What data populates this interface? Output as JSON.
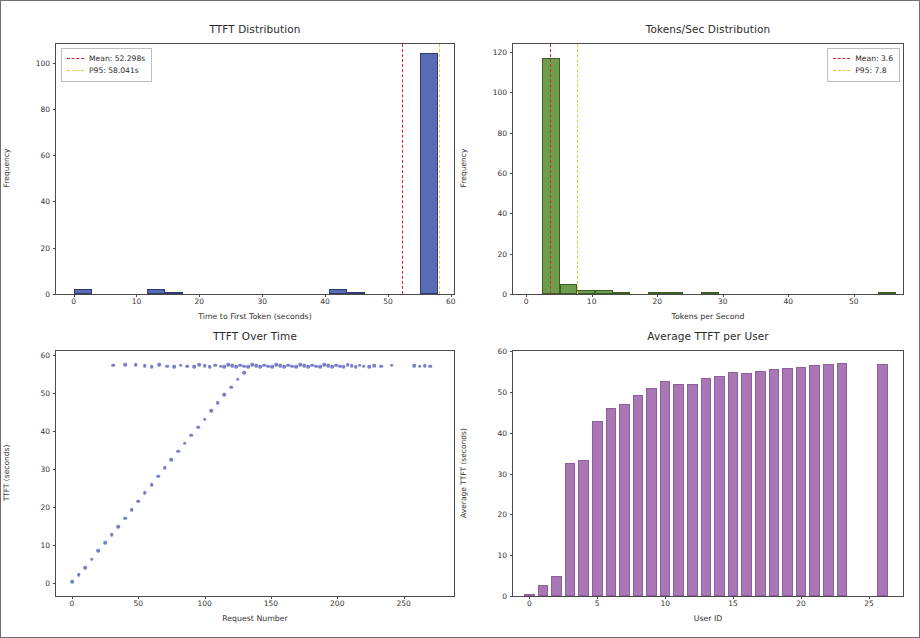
{
  "figure": {
    "background": "#ffffff",
    "border_color": "#6e6e73"
  },
  "panels": {
    "ttft_hist": {
      "title": "TTFT Distribution",
      "xlabel": "Time to First Token (seconds)",
      "ylabel": "Frequency",
      "legend": [
        {
          "label": "Mean: 52.298s",
          "color": "#d62728"
        },
        {
          "label": "P95: 58.041s",
          "color": "#e8c547"
        }
      ]
    },
    "tps_hist": {
      "title": "Tokens/Sec Distribution",
      "xlabel": "Tokens per Second",
      "ylabel": "Frequency",
      "legend": [
        {
          "label": "Mean: 3.6",
          "color": "#d62728"
        },
        {
          "label": "P95: 7.8",
          "color": "#e8c547"
        }
      ]
    },
    "ttft_time": {
      "title": "TTFT Over Time",
      "xlabel": "Request Number",
      "ylabel": "TTFT (seconds)"
    },
    "ttft_user": {
      "title": "Average TTFT per User",
      "xlabel": "User ID",
      "ylabel": "Average TTFT (seconds)"
    }
  },
  "chart_data": [
    {
      "type": "bar",
      "id": "ttft_hist",
      "title": "TTFT Distribution",
      "xlabel": "Time to First Token (seconds)",
      "ylabel": "Frequency",
      "xlim": [
        -2.8,
        60.5
      ],
      "ylim": [
        0,
        108
      ],
      "xticks": [
        0,
        10,
        20,
        30,
        40,
        50,
        60
      ],
      "yticks": [
        0,
        20,
        40,
        60,
        80,
        100
      ],
      "grid": false,
      "bar_color": "#5a6bb5",
      "edge_color": "#2f3a6e",
      "bin_width": 2.9,
      "bin_left_edges": [
        0.0,
        2.9,
        5.8,
        8.7,
        11.6,
        14.5,
        17.4,
        20.3,
        23.2,
        26.1,
        29.0,
        31.9,
        34.8,
        37.7,
        40.6,
        43.5,
        46.4,
        49.3,
        52.2,
        55.1
      ],
      "values": [
        2,
        0,
        0,
        0,
        2,
        1,
        0,
        0,
        0,
        0,
        0,
        0,
        0,
        0,
        2,
        1,
        0,
        0,
        0,
        104
      ],
      "annotations": [
        {
          "kind": "vline",
          "label": "Mean: 52.298s",
          "x": 52.298,
          "color": "#d62728",
          "style": "dashed"
        },
        {
          "kind": "vline",
          "label": "P95: 58.041s",
          "x": 58.041,
          "color": "#e8c547",
          "style": "dashed"
        }
      ],
      "legend_position": "upper left"
    },
    {
      "type": "bar",
      "id": "tps_hist",
      "title": "Tokens/Sec Distribution",
      "xlabel": "Tokens per Second",
      "ylabel": "Frequency",
      "xlim": [
        -2.0,
        57.5
      ],
      "ylim": [
        0,
        124
      ],
      "xticks": [
        0,
        10,
        20,
        30,
        40,
        50
      ],
      "yticks": [
        0,
        20,
        40,
        60,
        80,
        100,
        120
      ],
      "grid": false,
      "bar_color": "#6f9d4e",
      "edge_color": "#3d5c26",
      "bin_width": 2.7,
      "bin_left_edges": [
        2.4,
        5.1,
        7.8,
        10.5,
        13.2,
        15.9,
        18.6,
        21.3,
        24.0,
        26.7,
        29.4,
        32.1,
        34.8,
        37.5,
        40.2,
        42.9,
        45.6,
        48.3,
        51.0,
        53.7
      ],
      "values": [
        117,
        5,
        2,
        2,
        1,
        0,
        1,
        1,
        0,
        1,
        0,
        0,
        0,
        0,
        0,
        0,
        0,
        0,
        0,
        1
      ],
      "annotations": [
        {
          "kind": "vline",
          "label": "Mean: 3.6",
          "x": 3.6,
          "color": "#d62728",
          "style": "dashed"
        },
        {
          "kind": "vline",
          "label": "P95: 7.8",
          "x": 7.8,
          "color": "#e8c547",
          "style": "dashed"
        }
      ],
      "legend_position": "upper right"
    },
    {
      "type": "scatter",
      "id": "ttft_time",
      "title": "TTFT Over Time",
      "xlabel": "Request Number",
      "ylabel": "TTFT (seconds)",
      "xlim": [
        -12,
        288
      ],
      "ylim": [
        -3.5,
        61
      ],
      "xticks": [
        0,
        50,
        100,
        150,
        200,
        250
      ],
      "yticks": [
        0,
        10,
        20,
        30,
        40,
        50,
        60
      ],
      "grid": false,
      "marker_color": "#6b76c4",
      "points": [
        [
          0,
          0.3
        ],
        [
          5,
          2.1
        ],
        [
          10,
          4.0
        ],
        [
          15,
          6.2
        ],
        [
          20,
          8.4
        ],
        [
          25,
          10.5
        ],
        [
          30,
          12.6
        ],
        [
          35,
          14.8
        ],
        [
          40,
          17.0
        ],
        [
          45,
          19.2
        ],
        [
          50,
          21.4
        ],
        [
          55,
          23.6
        ],
        [
          60,
          25.8
        ],
        [
          65,
          28.0
        ],
        [
          70,
          30.2
        ],
        [
          75,
          32.4
        ],
        [
          80,
          34.6
        ],
        [
          85,
          36.7
        ],
        [
          90,
          38.8
        ],
        [
          95,
          40.9
        ],
        [
          100,
          43.0
        ],
        [
          105,
          45.2
        ],
        [
          110,
          47.3
        ],
        [
          115,
          49.4
        ],
        [
          120,
          51.5
        ],
        [
          125,
          53.6
        ],
        [
          130,
          55.3
        ],
        [
          31,
          57.2
        ],
        [
          40,
          57.4
        ],
        [
          48,
          57.3
        ],
        [
          55,
          57.1
        ],
        [
          60,
          56.9
        ],
        [
          66,
          57.3
        ],
        [
          72,
          57.0
        ],
        [
          77,
          56.8
        ],
        [
          82,
          57.2
        ],
        [
          87,
          57.0
        ],
        [
          92,
          56.9
        ],
        [
          96,
          57.3
        ],
        [
          100,
          57.1
        ],
        [
          104,
          56.8
        ],
        [
          108,
          57.2
        ],
        [
          112,
          57.0
        ],
        [
          115,
          56.9
        ],
        [
          118,
          57.3
        ],
        [
          121,
          57.1
        ],
        [
          124,
          56.8
        ],
        [
          127,
          57.2
        ],
        [
          130,
          57.0
        ],
        [
          133,
          56.9
        ],
        [
          136,
          57.3
        ],
        [
          139,
          57.1
        ],
        [
          142,
          56.8
        ],
        [
          145,
          57.2
        ],
        [
          148,
          57.0
        ],
        [
          151,
          56.9
        ],
        [
          154,
          57.3
        ],
        [
          157,
          57.1
        ],
        [
          160,
          56.8
        ],
        [
          163,
          57.2
        ],
        [
          166,
          57.0
        ],
        [
          169,
          56.9
        ],
        [
          172,
          57.3
        ],
        [
          175,
          57.1
        ],
        [
          178,
          56.8
        ],
        [
          181,
          57.2
        ],
        [
          184,
          57.0
        ],
        [
          187,
          56.9
        ],
        [
          190,
          57.3
        ],
        [
          193,
          57.1
        ],
        [
          196,
          56.8
        ],
        [
          199,
          57.2
        ],
        [
          202,
          57.0
        ],
        [
          205,
          56.9
        ],
        [
          208,
          57.3
        ],
        [
          211,
          57.1
        ],
        [
          214,
          56.8
        ],
        [
          217,
          57.2
        ],
        [
          220,
          57.0
        ],
        [
          224,
          56.9
        ],
        [
          228,
          57.1
        ],
        [
          233,
          57.0
        ],
        [
          241,
          57.2
        ],
        [
          258,
          57.1
        ],
        [
          262,
          57.0
        ],
        [
          266,
          57.1
        ],
        [
          270,
          57.0
        ]
      ]
    },
    {
      "type": "bar",
      "id": "ttft_user",
      "title": "Average TTFT per User",
      "xlabel": "User ID",
      "ylabel": "Average TTFT (seconds)",
      "xlim": [
        -1.2,
        27.5
      ],
      "ylim": [
        0,
        60
      ],
      "xticks": [
        0,
        5,
        10,
        15,
        20,
        25
      ],
      "yticks": [
        0,
        10,
        20,
        30,
        40,
        50,
        60
      ],
      "grid": false,
      "bar_color": "#a977b5",
      "edge_color": "#8e5f9b",
      "categories": [
        0,
        1,
        2,
        3,
        4,
        5,
        6,
        7,
        8,
        9,
        10,
        11,
        12,
        13,
        14,
        15,
        16,
        17,
        18,
        19,
        20,
        21,
        22,
        23,
        26
      ],
      "values": [
        0.2,
        2.8,
        4.9,
        32.6,
        33.4,
        42.9,
        46.0,
        47.0,
        49.2,
        51.0,
        52.6,
        52.0,
        51.8,
        53.4,
        53.9,
        54.9,
        54.5,
        55.2,
        55.7,
        55.9,
        56.2,
        56.5,
        56.7,
        57.0,
        56.8
      ]
    }
  ]
}
